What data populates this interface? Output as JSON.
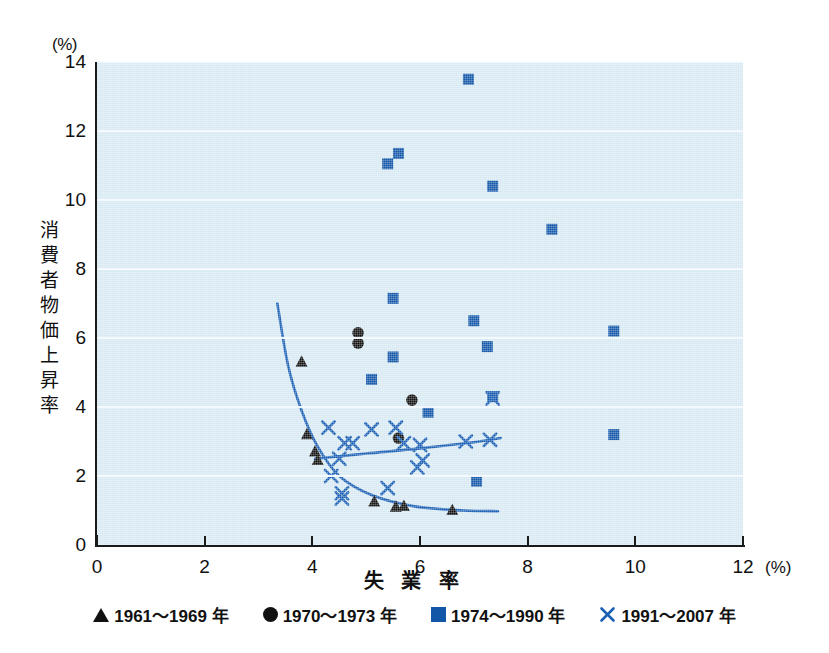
{
  "chart_data": {
    "type": "scatter",
    "title": "",
    "xlabel": "失業率",
    "ylabel": "消費者物価上昇率",
    "x_unit": "(%)",
    "y_unit": "(%)",
    "xlim": [
      0,
      12
    ],
    "ylim": [
      0,
      14
    ],
    "xticks": [
      "0",
      "2",
      "4",
      "6",
      "8",
      "10",
      "12"
    ],
    "yticks": [
      "0",
      "2",
      "4",
      "6",
      "8",
      "10",
      "12",
      "14"
    ],
    "grid": "horizontal",
    "legend_position": "bottom",
    "plot_bgcolor": "#d7e9f3",
    "gridline_color": "#f4fbff",
    "series": [
      {
        "name": "1961～1969 年",
        "marker": "triangle",
        "color": "#111111",
        "points": [
          [
            3.8,
            5.3
          ],
          [
            3.9,
            3.2
          ],
          [
            4.05,
            2.7
          ],
          [
            4.1,
            2.45
          ],
          [
            5.15,
            1.25
          ],
          [
            5.55,
            1.1
          ],
          [
            5.7,
            1.12
          ],
          [
            6.6,
            1.0
          ]
        ]
      },
      {
        "name": "1970～1973 年",
        "marker": "circle",
        "color": "#111111",
        "points": [
          [
            4.85,
            6.15
          ],
          [
            4.85,
            5.85
          ],
          [
            5.85,
            4.2
          ],
          [
            5.6,
            3.1
          ]
        ]
      },
      {
        "name": "1974～1990 年",
        "marker": "square",
        "color": "#1256a8",
        "points": [
          [
            6.9,
            13.5
          ],
          [
            5.4,
            11.05
          ],
          [
            5.6,
            11.35
          ],
          [
            7.35,
            10.4
          ],
          [
            8.45,
            9.15
          ],
          [
            5.5,
            7.15
          ],
          [
            7.0,
            6.5
          ],
          [
            9.6,
            6.2
          ],
          [
            7.25,
            5.75
          ],
          [
            5.5,
            5.45
          ],
          [
            5.1,
            4.8
          ],
          [
            7.35,
            4.3
          ],
          [
            6.15,
            3.85
          ],
          [
            9.6,
            3.2
          ],
          [
            7.05,
            1.85
          ]
        ]
      },
      {
        "name": "1991～2007 年",
        "marker": "cross",
        "color": "#1a5fb4",
        "points": [
          [
            7.35,
            4.25
          ],
          [
            4.3,
            3.4
          ],
          [
            5.1,
            3.35
          ],
          [
            5.55,
            3.4
          ],
          [
            4.6,
            2.95
          ],
          [
            4.75,
            2.95
          ],
          [
            5.7,
            2.95
          ],
          [
            6.0,
            2.9
          ],
          [
            6.85,
            3.0
          ],
          [
            7.3,
            3.05
          ],
          [
            4.5,
            2.5
          ],
          [
            5.95,
            2.25
          ],
          [
            6.05,
            2.45
          ],
          [
            4.35,
            2.0
          ],
          [
            5.4,
            1.65
          ],
          [
            4.55,
            1.5
          ],
          [
            4.55,
            1.35
          ]
        ]
      }
    ],
    "fit_curves": [
      {
        "name": "phillips-curve-old",
        "color": "#1a5fb4",
        "path_points": [
          [
            3.35,
            7.0
          ],
          [
            3.55,
            5.2
          ],
          [
            3.8,
            3.9
          ],
          [
            4.1,
            2.85
          ],
          [
            4.5,
            2.0
          ],
          [
            5.1,
            1.45
          ],
          [
            5.9,
            1.12
          ],
          [
            6.8,
            1.0
          ],
          [
            7.45,
            0.98
          ]
        ]
      },
      {
        "name": "phillips-curve-new",
        "color": "#1a5fb4",
        "path_points": [
          [
            4.05,
            2.5
          ],
          [
            5.0,
            2.65
          ],
          [
            6.0,
            2.8
          ],
          [
            7.0,
            2.98
          ],
          [
            7.5,
            3.1
          ]
        ]
      }
    ]
  },
  "axis": {
    "y_unit_label": "(%)",
    "x_unit_label": "(%)",
    "y_title_chars": [
      "消",
      "費",
      "者",
      "物",
      "価",
      "上",
      "昇",
      "率"
    ],
    "x_title": "失 業 率",
    "zero_label": "0"
  },
  "legend": {
    "items": [
      {
        "marker": "triangle",
        "label": "1961～1969 年",
        "color": "#111111"
      },
      {
        "marker": "circle",
        "label": "1970～1973 年",
        "color": "#111111"
      },
      {
        "marker": "square",
        "label": "1974～1990 年",
        "color": "#1256a8"
      },
      {
        "marker": "cross",
        "label": "1991～2007 年",
        "color": "#1a5fb4"
      }
    ]
  }
}
